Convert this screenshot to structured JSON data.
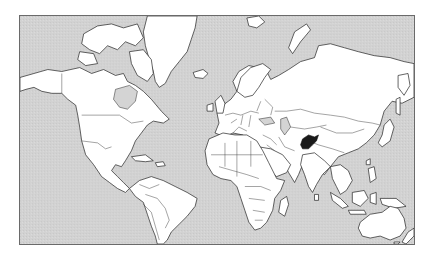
{
  "map": {
    "projection": "Mercator world outline map",
    "ocean_color": "#d4d4d4",
    "land_color": "#ffffff",
    "border_color": "#222222",
    "highlighted_region": {
      "name": "Afghanistan",
      "fill_color": "#1a1a1a"
    },
    "continents": [
      "North America",
      "South America",
      "Europe",
      "Africa",
      "Asia",
      "Oceania",
      "Greenland"
    ]
  }
}
